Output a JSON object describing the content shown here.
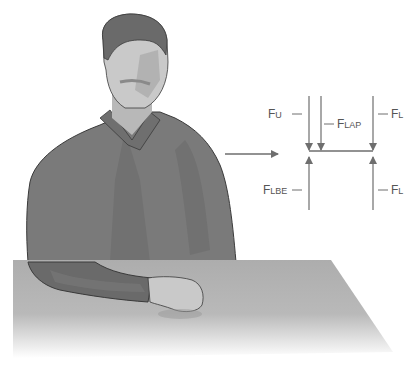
{
  "figure": {
    "colors": {
      "shirt": "#7a7a7a",
      "shirt_dark": "#5f5f5f",
      "skin": "#c9c9c9",
      "skin_shadow": "#a8a8a8",
      "hair": "#6a6a6a",
      "table_top": "#b0b0b0",
      "arrow": "#6e6e6e",
      "label": "#555555"
    }
  },
  "diagram": {
    "direction_arrow": "right-arrow",
    "labels": {
      "fu": {
        "main": "F",
        "sub": "U"
      },
      "flap": {
        "main": "F",
        "sub": "LAP"
      },
      "fl_top": {
        "main": "F",
        "sub": "L"
      },
      "flbe": {
        "main": "F",
        "sub": "LBE"
      },
      "fl_bottom": {
        "main": "F",
        "sub": "L"
      }
    }
  }
}
